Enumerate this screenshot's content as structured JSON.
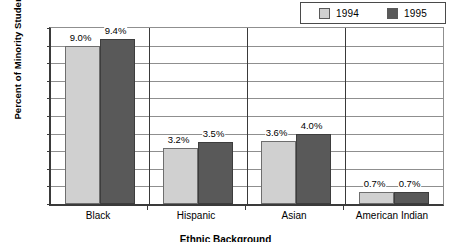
{
  "chart_data": {
    "type": "bar",
    "title": "",
    "xlabel": "Ethnic Background",
    "ylabel": "Percent of Minority Students",
    "categories": [
      "Black",
      "Hispanic",
      "Asian",
      "American Indian"
    ],
    "series": [
      {
        "name": "1994",
        "values": [
          9.0,
          3.2,
          3.6,
          0.7
        ],
        "color": "#d0d0d0"
      },
      {
        "name": "1995",
        "values": [
          9.4,
          3.5,
          4.0,
          0.7
        ],
        "color": "#595959"
      }
    ],
    "value_labels": [
      [
        "9.0%",
        "3.2%",
        "3.6%",
        "0.7%"
      ],
      [
        "9.4%",
        "3.5%",
        "4.0%",
        "0.7%"
      ]
    ],
    "ylim": [
      0,
      10
    ],
    "ytick_values": [
      0,
      1,
      2,
      3,
      4,
      5,
      6,
      7,
      8,
      9,
      10
    ],
    "ytick_labels": [
      "0%",
      "1%",
      "2%",
      "3%",
      "4%",
      "5%",
      "6%",
      "7%",
      "8%",
      "9%",
      "10%"
    ],
    "grid": true,
    "legend_position": "top-right"
  },
  "legend": {
    "entries": [
      {
        "label": "1994",
        "color": "#d0d0d0"
      },
      {
        "label": "1995",
        "color": "#595959"
      }
    ]
  },
  "axes": {
    "y_title": "Percent of Minority Students",
    "x_title": "Ethnic Background"
  }
}
